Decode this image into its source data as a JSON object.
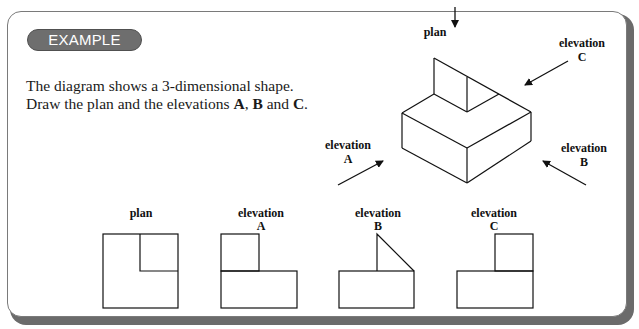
{
  "badge": {
    "label": "EXAMPLE"
  },
  "intro": {
    "line1": "The diagram shows a 3-dimensional shape.",
    "line2_prefix": "Draw the plan and the elevations ",
    "a": "A",
    "sep1": ", ",
    "b": "B",
    "sep2": " and ",
    "c": "C",
    "end": "."
  },
  "iso": {
    "plan_label": "plan",
    "elev_a": {
      "line1": "elevation",
      "line2": "A"
    },
    "elev_b": {
      "line1": "elevation",
      "line2": "B"
    },
    "elev_c": {
      "line1": "elevation",
      "line2": "C"
    }
  },
  "views": [
    {
      "line1": "plan",
      "line2": ""
    },
    {
      "line1": "elevation",
      "line2": "A"
    },
    {
      "line1": "elevation",
      "line2": "B"
    },
    {
      "line1": "elevation",
      "line2": "C"
    }
  ],
  "colors": {
    "ink": "#111111",
    "badge": "#6e6e6e",
    "frame_shadow": "#6b6b6b"
  }
}
